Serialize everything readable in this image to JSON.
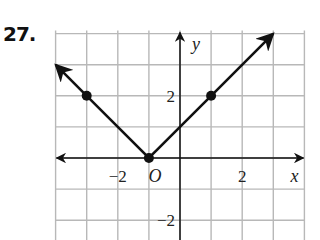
{
  "problem_number": "27.",
  "chart_data": {
    "type": "line",
    "title": "",
    "xlabel": "x",
    "ylabel": "y",
    "origin_label": "O",
    "xlim": [
      -4,
      4
    ],
    "ylim": [
      -2.6,
      4.1
    ],
    "grid": true,
    "x_tick_labels": [
      {
        "value": -2,
        "label": "−2"
      },
      {
        "value": 2,
        "label": "2"
      }
    ],
    "y_tick_labels": [
      {
        "value": 2,
        "label": "2"
      },
      {
        "value": -2,
        "label": "−2"
      }
    ],
    "series": [
      {
        "name": "absolute value graph",
        "x": [
          -4,
          -3,
          -1,
          1,
          3
        ],
        "y": [
          3,
          2,
          0,
          2,
          4
        ],
        "marked_points": [
          [
            -3,
            2
          ],
          [
            -1,
            0
          ],
          [
            1,
            2
          ]
        ],
        "arrows_at_ends": true
      }
    ],
    "colors": {
      "grid": "#b8b8b8",
      "line": "#111111"
    }
  }
}
